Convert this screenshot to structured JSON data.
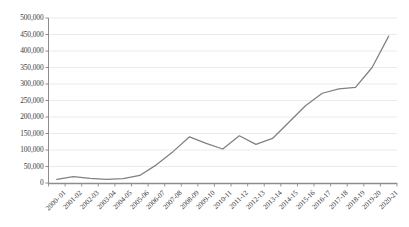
{
  "chart_data": {
    "type": "line",
    "title": "",
    "subtitle": "",
    "xlabel": "",
    "ylabel": "",
    "ylim": [
      0,
      500000
    ],
    "ytick_step": 50000,
    "grid": true,
    "legend_position": "none",
    "line_color": "#808080",
    "grid_color": "#e6e6e6",
    "axis_color": "#8c8c8c",
    "tick_label_color": "#3a3a3a",
    "ytick_labels": [
      "500,000",
      "450,000",
      "400,000",
      "350,000",
      "300,000",
      "250,000",
      "200,000",
      "150,000",
      "100,000",
      "50,000",
      "0"
    ],
    "categories": [
      "2000- 01",
      "2001-02",
      "2002-03",
      "2003-04",
      "2004-05",
      "2005-06",
      "2006-07",
      "2007-08",
      "2008-09",
      "2009-10",
      "2010-11",
      "2011-12",
      "2012-13",
      "2013-14",
      "2014-15",
      "2015-16",
      "2016-17",
      "2017-18",
      "2018-19",
      "2019-20",
      "2020-21"
    ],
    "values": [
      11000,
      19000,
      14000,
      11000,
      13000,
      23000,
      55000,
      95000,
      140000,
      120000,
      103000,
      143000,
      117000,
      135000,
      185000,
      235000,
      272000,
      285000,
      290000,
      350000,
      445000
    ]
  }
}
